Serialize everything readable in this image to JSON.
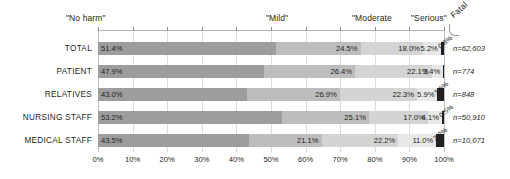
{
  "chart_data": {
    "type": "bar",
    "orientation": "horizontal",
    "stacked": true,
    "normalized_percent": true,
    "title": "",
    "xlabel": "",
    "ylabel": "",
    "xlim": [
      0,
      100
    ],
    "grid": true,
    "legend_position": "top",
    "categories": [
      "TOTAL",
      "PATIENT",
      "RELATIVES",
      "NURSING STAFF",
      "MEDICAL STAFF"
    ],
    "series": [
      {
        "name": "\"No harm\"",
        "color": "#9d9d9d",
        "values": [
          51.4,
          47.9,
          43.0,
          53.2,
          43.5
        ]
      },
      {
        "name": "\"Mild\"",
        "color": "#bdbdbd",
        "values": [
          24.5,
          26.4,
          26.9,
          25.1,
          21.1
        ]
      },
      {
        "name": "\"Moderate",
        "color": "#d4d4d4",
        "values": [
          18.0,
          22.1,
          22.3,
          17.0,
          22.2
        ]
      },
      {
        "name": "\"Serious\"",
        "color": "#e8e8e8",
        "values": [
          5.2,
          3.4,
          5.9,
          4.1,
          11.0
        ]
      },
      {
        "name": "Fatal",
        "color": "#231f20",
        "values": [
          0.8,
          0.2,
          1.9,
          0.5,
          2.2
        ]
      }
    ],
    "value_labels": [
      [
        "51.4%",
        "24.5%",
        "18.0%",
        "5.2%",
        "0.8%"
      ],
      [
        "47.9%",
        "26.4%",
        "22.1%",
        "3.4%",
        ""
      ],
      [
        "43.0%",
        "26.9%",
        "22.3%",
        "5.9%",
        "1.6%"
      ],
      [
        "53.2%",
        "25.1%",
        "17.0%",
        "4.1%",
        "0.5%"
      ],
      [
        "43.5%",
        "21.1%",
        "22.2%",
        "11.0%",
        "2.2%"
      ]
    ],
    "annotations": [
      "n=62,603",
      "n=774",
      "n=848",
      "n=50,910",
      "n=10,071"
    ],
    "xticks": [
      0,
      10,
      20,
      30,
      40,
      50,
      60,
      70,
      80,
      90,
      100
    ],
    "xticklabels": [
      "0%",
      "10%",
      "20%",
      "30%",
      "40%",
      "50%",
      "60%",
      "70%",
      "80%",
      "90%",
      "100%"
    ]
  },
  "header": {
    "no_harm": "\"No harm\"",
    "mild": "\"Mild\"",
    "moderate": "\"Moderate",
    "serious": "\"Serious\"",
    "fatal": "Fatal"
  },
  "rows": [
    {
      "label": "TOTAL",
      "n": "n=62,603"
    },
    {
      "label": "PATIENT",
      "n": "n=774"
    },
    {
      "label": "RELATIVES",
      "n": "n=848"
    },
    {
      "label": "NURSING STAFF",
      "n": "n=50,910"
    },
    {
      "label": "MEDICAL STAFF",
      "n": "n=10,071"
    }
  ]
}
